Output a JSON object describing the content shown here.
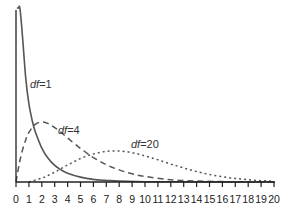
{
  "chart_data": {
    "type": "line",
    "title": "",
    "xlabel": "",
    "ylabel": "",
    "xlim": [
      0,
      20
    ],
    "grid": false,
    "legend": "inline labels",
    "x_ticks": [
      0,
      1,
      2,
      3,
      4,
      5,
      6,
      7,
      8,
      9,
      10,
      11,
      12,
      13,
      14,
      15,
      16,
      17,
      18,
      19,
      20
    ],
    "x_tick_labels": [
      "0",
      "1",
      "2",
      "3",
      "4",
      "5",
      "6",
      "7",
      "8",
      "9",
      "10",
      "11",
      "12",
      "13",
      "14",
      "15",
      "16",
      "17",
      "18",
      "19",
      "20"
    ],
    "series": [
      {
        "name": "df=1",
        "style": "solid",
        "color": "#555555",
        "x": [
          0.12,
          0.2,
          0.3,
          0.5,
          0.75,
          1,
          1.25,
          1.5,
          2,
          2.5,
          3,
          3.5,
          4,
          5,
          6,
          7,
          8,
          10,
          12,
          15,
          20
        ],
        "y": [
          1.1,
          0.85,
          0.66,
          0.45,
          0.32,
          0.24,
          0.19,
          0.154,
          0.104,
          0.072,
          0.051,
          0.037,
          0.027,
          0.015,
          0.008,
          0.005,
          0.003,
          0.001,
          0.0005,
          0.0002,
          0.0001
        ]
      },
      {
        "name": "df=4",
        "style": "dashed",
        "color": "#555555",
        "x": [
          0,
          0.25,
          0.5,
          0.75,
          1,
          1.5,
          2,
          2.5,
          3,
          3.5,
          4,
          5,
          6,
          7,
          8,
          9,
          10,
          12,
          14,
          16,
          18,
          20
        ],
        "y": [
          0,
          0.055,
          0.097,
          0.129,
          0.152,
          0.177,
          0.184,
          0.179,
          0.167,
          0.152,
          0.135,
          0.103,
          0.075,
          0.053,
          0.037,
          0.025,
          0.017,
          0.007,
          0.003,
          0.0013,
          0.0006,
          0.0002
        ]
      },
      {
        "name": "df=20",
        "style": "dotted",
        "color": "#555555",
        "x": [
          1,
          2,
          3,
          4,
          5,
          6,
          7,
          8,
          9,
          10,
          11,
          12,
          13,
          14,
          15,
          16,
          17,
          18,
          19,
          20
        ],
        "y": [
          0.0,
          0.012,
          0.03,
          0.052,
          0.072,
          0.086,
          0.094,
          0.095,
          0.09,
          0.08,
          0.068,
          0.055,
          0.043,
          0.032,
          0.023,
          0.016,
          0.011,
          0.007,
          0.004,
          0.003
        ]
      }
    ],
    "annotations": [
      {
        "text_italic": "df",
        "text": "=1",
        "x": 1.05,
        "y": 0.42
      },
      {
        "text_italic": "df",
        "text": "=4",
        "x": 3.0,
        "y": 0.15
      },
      {
        "text_italic": "df",
        "text": "=20",
        "x": 7.9,
        "y": 0.1
      }
    ]
  },
  "labels": {
    "df1_italic": "df",
    "df1_rest": "=1",
    "df4_italic": "df",
    "df4_rest": "=4",
    "df20_italic": "df",
    "df20_rest": "=20"
  }
}
